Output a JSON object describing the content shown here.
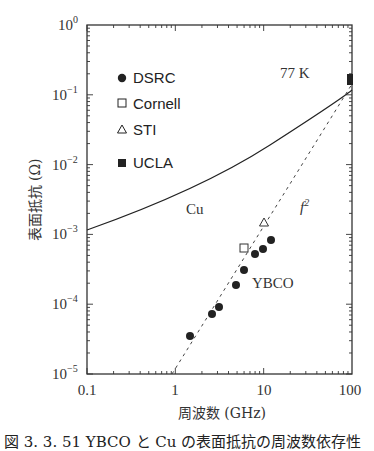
{
  "chart_data": {
    "type": "scatter",
    "title": "",
    "xlabel": "周波数 (GHz)",
    "ylabel": "表面抵抗 (Ω)",
    "xscale": "log",
    "yscale": "log",
    "xlim": [
      0.1,
      100
    ],
    "ylim": [
      1e-05,
      1
    ],
    "x_ticks": [
      "0.1",
      "1",
      "10",
      "100"
    ],
    "y_ticks": [
      "10^0",
      "10^-1",
      "10^-2",
      "10^-3",
      "10^-4",
      "10^-5"
    ],
    "grid": false,
    "legend_position": "upper left",
    "annotations": [
      "77 K",
      "Cu",
      "YBCO",
      "f^2"
    ],
    "series": [
      {
        "name": "DSRC",
        "marker": "filled-circle",
        "x": [
          1.5,
          2.7,
          3.2,
          5.0,
          5.8,
          7.8,
          9.5,
          11.5
        ],
        "y": [
          3.5e-05,
          7e-05,
          9e-05,
          0.00019,
          0.0003,
          0.0005,
          0.0006,
          0.0008
        ]
      },
      {
        "name": "Cornell",
        "marker": "open-square",
        "x": [
          5.6
        ],
        "y": [
          0.0006
        ]
      },
      {
        "name": "STI",
        "marker": "open-triangle",
        "x": [
          10
        ],
        "y": [
          0.0015
        ]
      },
      {
        "name": "UCLA",
        "marker": "filled-square",
        "x": [
          98
        ],
        "y": [
          0.065
        ]
      },
      {
        "name": "Cu",
        "type": "line",
        "style": "solid",
        "x": [
          0.1,
          1,
          10,
          100
        ],
        "y": [
          0.0013,
          0.0045,
          0.017,
          0.1
        ]
      },
      {
        "name": "f^2",
        "type": "line",
        "style": "dashed",
        "x": [
          1,
          100
        ],
        "y": [
          1e-05,
          0.06
        ]
      }
    ]
  },
  "legend": [
    {
      "label": "DSRC",
      "marker": "filled-circle"
    },
    {
      "label": "Cornell",
      "marker": "open-square"
    },
    {
      "label": "STI",
      "marker": "open-triangle"
    },
    {
      "label": "UCLA",
      "marker": "filled-square"
    }
  ],
  "labels": {
    "temp": "77 K",
    "cu": "Cu",
    "ybco": "YBCO",
    "f2": "f",
    "f2_sup": "2",
    "xlabel": "周波数 (GHz)",
    "ylabel": "表面抵抗 (Ω)",
    "caption": "図 3. 3. 51   YBCO と Cu の表面抵抗の周波数依存性"
  },
  "ticks": {
    "x": [
      "0.1",
      "1",
      "10",
      "100"
    ],
    "y_base": "10",
    "y_exp": [
      "0",
      "−1",
      "−2",
      "−3",
      "−4",
      "−5"
    ]
  },
  "colors": {
    "ink": "#222222",
    "axis": "#333333"
  }
}
